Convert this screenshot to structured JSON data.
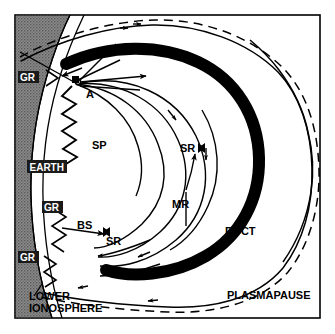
{
  "figure": {
    "frame_color": "#000000",
    "background_color": "#ffffff",
    "earth_fill_color": "#808080",
    "duct_color": "#000000",
    "ray_color": "#000000"
  },
  "labels": {
    "earth": "EARTH",
    "gr_top": "GR",
    "gr_mid": "GR",
    "gr_bottom": "GR",
    "point_a": "A",
    "sp": "SP",
    "bs": "BS",
    "sr_lower": "SR",
    "sr_upper": "SR",
    "mr": "MR",
    "duct": "DUCT",
    "plasmapause": "PLASMAPAUSE",
    "lower_ionosphere_line1": "LOWER",
    "lower_ionosphere_line2": "IONOSPHERE"
  },
  "legend_meaning": {
    "GR": "ground reflection",
    "A": "source point",
    "SP": "subprotonospheric path",
    "BS": "backscatter",
    "SR": "specular reflection",
    "MR": "magnetospheric reflection",
    "DUCT": "field-aligned duct",
    "PLASMAPAUSE": "plasmapause boundary"
  }
}
